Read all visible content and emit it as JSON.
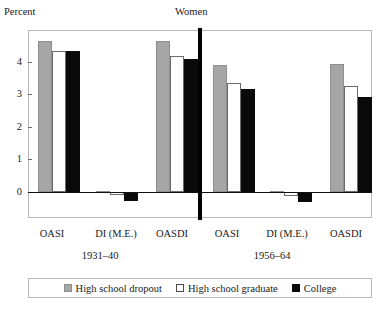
{
  "chart_data": {
    "type": "bar",
    "title": "Women",
    "ylabel": "Percent",
    "xlabel": "",
    "ylim": [
      -0.55,
      5.0
    ],
    "yticks": [
      0,
      1,
      2,
      3,
      4
    ],
    "ytick_labels": [
      "0",
      "1",
      "2",
      "3",
      "4"
    ],
    "grid": false,
    "legend_position": "bottom",
    "categories": [
      "OASI",
      "DI (M.E.)",
      "OASDI",
      "OASI",
      "DI (M.E.)",
      "OASDI"
    ],
    "groups": [
      {
        "name": "1931–40",
        "categories": [
          "OASI",
          "DI (M.E.)",
          "OASDI"
        ]
      },
      {
        "name": "1956–64",
        "categories": [
          "OASI",
          "DI (M.E.)",
          "OASDI"
        ]
      }
    ],
    "series": [
      {
        "name": "High school dropout",
        "color": "#a6a6a6",
        "values": [
          4.65,
          0.02,
          4.65,
          3.9,
          0.02,
          3.95
        ]
      },
      {
        "name": "High school graduate",
        "color": "#ffffff",
        "values": [
          4.35,
          -0.1,
          4.2,
          3.35,
          -0.12,
          3.25
        ]
      },
      {
        "name": "College",
        "color": "#0a0a0a",
        "values": [
          4.35,
          -0.27,
          4.1,
          3.17,
          -0.3,
          2.92
        ]
      }
    ]
  },
  "chart": {
    "ylabel": "Percent",
    "panel_title": "Women",
    "ytick_labels": [
      "4",
      "3",
      "2",
      "1",
      "0"
    ],
    "category_labels": [
      "OASI",
      "DI (M.E.)",
      "OASDI",
      "OASI",
      "DI (M.E.)",
      "OASDI"
    ],
    "cohort_labels": [
      "1931–40",
      "1956–64"
    ],
    "legend": [
      {
        "label": "High school dropout",
        "swatch": "dropout"
      },
      {
        "label": "High school graduate",
        "swatch": "graduate"
      },
      {
        "label": "College",
        "swatch": "college"
      }
    ]
  }
}
